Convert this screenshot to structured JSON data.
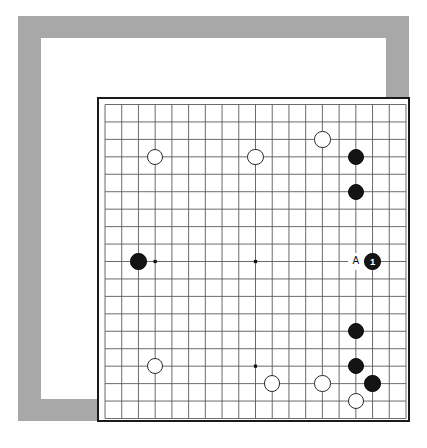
{
  "diagram": {
    "board": {
      "size": 19,
      "columns": 19,
      "rows": 19,
      "cell_px": 16.3,
      "line_color": "#5a5a5a",
      "edge_color": "#1a1a1a",
      "board_color": "#ffffff",
      "star_points": [
        {
          "col": 4,
          "row": 4
        },
        {
          "col": 10,
          "row": 4
        },
        {
          "col": 16,
          "row": 4
        },
        {
          "col": 4,
          "row": 10
        },
        {
          "col": 10,
          "row": 10
        },
        {
          "col": 16,
          "row": 10
        },
        {
          "col": 4,
          "row": 16
        },
        {
          "col": 10,
          "row": 16
        },
        {
          "col": 16,
          "row": 16
        }
      ]
    },
    "frame": {
      "outer_color": "#a8a8a8",
      "mat_color": "#ffffff",
      "page_color": "#ffffff"
    },
    "stones": [
      {
        "id": "w-d16",
        "color": "white",
        "col": 4,
        "row": 4,
        "label": ""
      },
      {
        "id": "w-k16",
        "color": "white",
        "col": 10,
        "row": 4,
        "label": ""
      },
      {
        "id": "w-o17",
        "color": "white",
        "col": 14,
        "row": 3,
        "label": ""
      },
      {
        "id": "b-q16",
        "color": "black",
        "col": 16,
        "row": 4,
        "label": ""
      },
      {
        "id": "b-q14",
        "color": "black",
        "col": 16,
        "row": 6,
        "label": ""
      },
      {
        "id": "b-c10",
        "color": "black",
        "col": 3,
        "row": 10,
        "label": ""
      },
      {
        "id": "b-r10",
        "color": "black",
        "col": 17,
        "row": 10,
        "label": "1"
      },
      {
        "id": "b-q6",
        "color": "black",
        "col": 16,
        "row": 14,
        "label": ""
      },
      {
        "id": "w-d4",
        "color": "white",
        "col": 4,
        "row": 16,
        "label": ""
      },
      {
        "id": "b-q4",
        "color": "black",
        "col": 16,
        "row": 16,
        "label": ""
      },
      {
        "id": "w-l3",
        "color": "white",
        "col": 11,
        "row": 17,
        "label": ""
      },
      {
        "id": "w-o3",
        "color": "white",
        "col": 14,
        "row": 17,
        "label": ""
      },
      {
        "id": "b-r3",
        "color": "black",
        "col": 17,
        "row": 17,
        "label": ""
      },
      {
        "id": "w-q2",
        "color": "white",
        "col": 16,
        "row": 18,
        "label": ""
      }
    ],
    "point_labels": [
      {
        "id": "label-a",
        "text": "A",
        "col": 16,
        "row": 10
      }
    ]
  }
}
